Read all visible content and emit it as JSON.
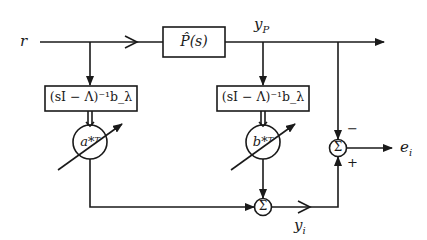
{
  "diagram": {
    "title": "",
    "signals": {
      "input": "r",
      "plant_output": "y_P",
      "identifier_output": "y_i",
      "error": "e_i"
    },
    "blocks": {
      "plant": "P̂(s)",
      "filter_left": "(sI − Λ)⁻¹b_λ",
      "filter_right": "(sI − Λ)⁻¹b_λ",
      "gain_left": "a*ᵀ",
      "gain_right": "b*ᵀ"
    },
    "summing_junctions": {
      "symbol": "Σ",
      "error_sum_signs": {
        "from_plant": "−",
        "from_identifier": "+"
      }
    },
    "colors": {
      "line": "#1a1a1a",
      "background": "#ffffff"
    }
  }
}
